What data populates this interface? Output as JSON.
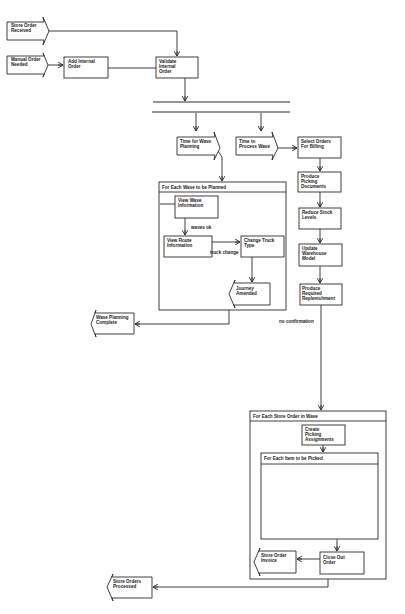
{
  "diagram": {
    "type": "uml-activity-diagram",
    "signals_in": {
      "store_order_received": "Store Order Received",
      "manual_order_needed": "Manual Order Needed",
      "time_for_wave_planning": "Time for Wave Planning",
      "time_to_process_wave": "Time to Process Wave"
    },
    "signals_out": {
      "wave_planning_complete": "Wave Planning Complete",
      "store_order_invoice": "Store Order Invoice",
      "store_orders_processed": "Store Orders Processed",
      "journey_amended": "Journey Amended"
    },
    "actions": {
      "add_internal_order": "Add Internal Order",
      "validate_internal_order": "Validate Internal Order",
      "select_orders_for_billing": "Select Orders For Billing",
      "produce_picking_documents": "Produce Picking Documents",
      "reduce_stock_levels": "Reduce Stock Levels",
      "update_warehouse_model": "Update Warehouse Model",
      "produce_required_replenishment": "Produce Required Replenishment",
      "view_wave_information": "View Wave Information",
      "view_route_information": "View Route Information",
      "change_truck_type": "Change Truck Type",
      "create_picking_assignments": "Create Picking Assignments",
      "close_out_order": "Close Out Order"
    },
    "loops": {
      "each_wave": "For Each Wave to be Planned",
      "each_store_order": "For Each Store Order in Wave",
      "each_item": "For Each Item to be Picked"
    },
    "edge_labels": {
      "waves_ok": "waves ok",
      "truck_change": "truck change",
      "no_confirmation": "no confirmation"
    },
    "colors": {
      "stroke": "#2a2a2a",
      "fill": "#ffffff",
      "text": "#1a1a1a"
    }
  }
}
